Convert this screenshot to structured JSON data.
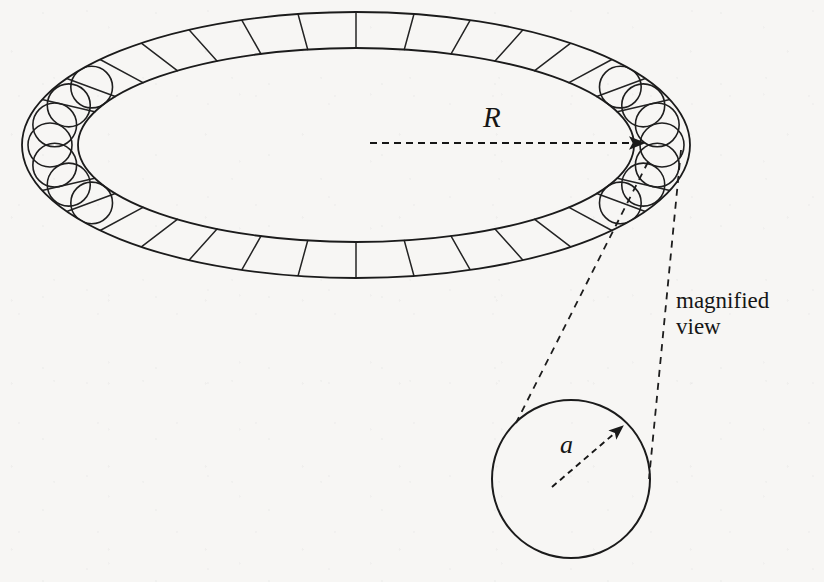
{
  "figure": {
    "background_color": "#f7f6f4",
    "ink_color": "#1a1a1a",
    "labels": {
      "major_radius": "R",
      "minor_radius": "a",
      "callout_line1": "magnified",
      "callout_line2": "view",
      "callout_full": "magnified view"
    },
    "icons": {
      "major_radius_arrow": "dashed-arrow-right-icon",
      "minor_radius_arrow": "dashed-arrow-diagonal-icon",
      "callout_leader_left": "dashed-leader-line-icon",
      "callout_leader_right": "dashed-leader-line-icon"
    },
    "torus": {
      "center_x": 356,
      "center_y": 145,
      "outer_rx": 334,
      "outer_ry": 133,
      "inner_rx": 278,
      "inner_ry": 97,
      "segment_count": 36,
      "tube_circle_radius": 22,
      "stroke_width": 1.6
    },
    "magnified_circle": {
      "center_x": 571,
      "center_y": 479,
      "radius": 79,
      "stroke_width": 2.0
    },
    "major_radius_arrow": {
      "x1": 370,
      "y1": 143,
      "x2": 645,
      "y2": 143
    },
    "minor_radius_arrow": {
      "x1": 552,
      "y1": 487,
      "x2": 623,
      "y2": 426
    },
    "leader_left": {
      "x1": 648,
      "y1": 162,
      "x2": 516,
      "y2": 423
    },
    "leader_right": {
      "x1": 681,
      "y1": 150,
      "x2": 649,
      "y2": 479
    }
  }
}
